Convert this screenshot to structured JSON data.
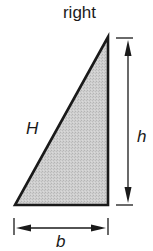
{
  "figure": {
    "title": "right",
    "shape": "right-triangle",
    "labels": {
      "hypotenuse": "H",
      "height": "h",
      "base": "b"
    },
    "colors": {
      "stroke": "#1a1a1a",
      "fill": "#c8c8c8",
      "background": "#ffffff"
    },
    "dimensions": [
      {
        "name": "height",
        "orientation": "vertical",
        "label": "h"
      },
      {
        "name": "base",
        "orientation": "horizontal",
        "label": "b"
      }
    ]
  }
}
